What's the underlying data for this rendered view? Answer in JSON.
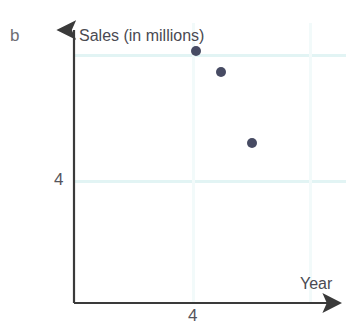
{
  "figure": {
    "part_label": "b",
    "background_color": "#ffffff",
    "point_color": "#474b63",
    "axis_color": "#3a3a3a",
    "grid_color": "#e2f4f4"
  },
  "chart_data": {
    "type": "scatter",
    "title": "",
    "xlabel": "Year",
    "ylabel": "Sales (in millions)",
    "x_tick_labels": [
      "4"
    ],
    "y_tick_labels": [
      "4"
    ],
    "grid": true,
    "legend": "none",
    "series": [
      {
        "name": "Sales",
        "points": [
          {
            "x": 196,
            "y": 51
          },
          {
            "x": 221,
            "y": 72
          },
          {
            "x": 252,
            "y": 143
          }
        ]
      }
    ],
    "annotations": []
  },
  "axes": {
    "y_axis": {
      "x": 74,
      "top": 23,
      "bottom": 303,
      "arrow": "up"
    },
    "x_axis": {
      "y": 303,
      "left": 74,
      "right": 346,
      "arrow": "right"
    }
  },
  "gridlines": {
    "horizontal": [
      55,
      181
    ],
    "vertical": [
      193,
      310
    ]
  }
}
